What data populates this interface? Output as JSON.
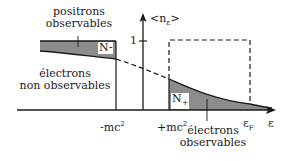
{
  "diagram": {
    "type": "occupation-number diagram",
    "y_axis_label": "<n",
    "y_axis_label_sub": "ε",
    "y_axis_label_close": ">",
    "y_tick_label": "1",
    "x_axis_label": "ε",
    "x_ticks": {
      "neg_mc2": "-mc",
      "pos_mc2": "+mc",
      "superscript": "2",
      "fermi": "ε",
      "fermi_sub": "F"
    },
    "regions": {
      "n_minus": "N-",
      "n_plus_main": "N",
      "n_plus_sign": "+"
    },
    "annotations": {
      "positrons_line1": "positrons",
      "positrons_line2": "observables",
      "electrons_non_line1": "électrons",
      "electrons_non_line2": "non observables",
      "electrons_obs_line1": "électrons",
      "electrons_obs_line2": "observables"
    },
    "colors": {
      "shade": "#8c8c8c",
      "line": "#1a1a1a",
      "background": "#ffffff"
    }
  }
}
